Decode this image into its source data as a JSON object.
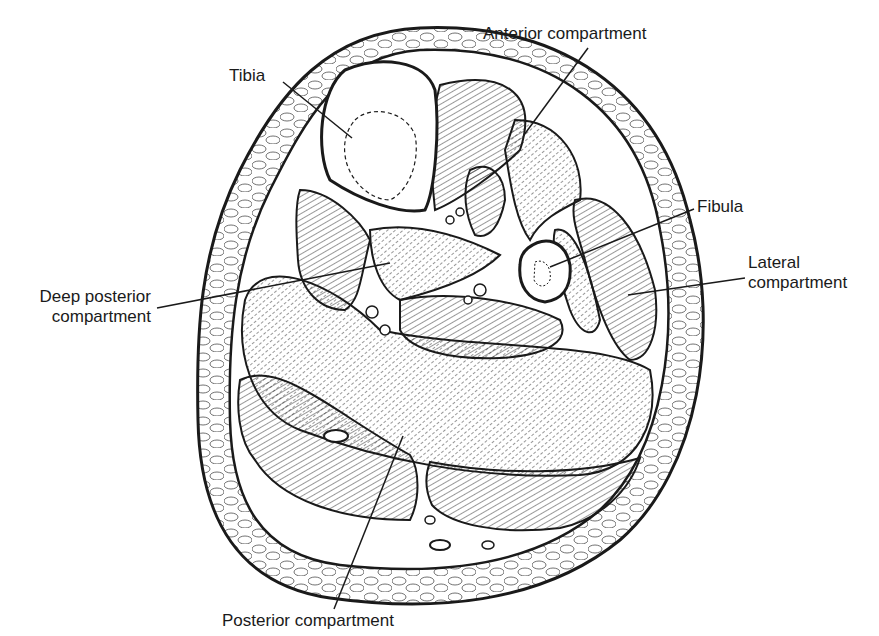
{
  "figure": {
    "type": "anatomical cross-section",
    "colors": {
      "ink": "#1a1a1a",
      "background": "#ffffff"
    }
  },
  "labels": {
    "tibia": "Tibia",
    "anterior": "Anterior compartment",
    "fibula": "Fibula",
    "deep_posterior_line1": "Deep posterior",
    "deep_posterior_line2": "compartment",
    "lateral_line1": "Lateral",
    "lateral_line2": "compartment",
    "posterior": "Posterior compartment"
  }
}
